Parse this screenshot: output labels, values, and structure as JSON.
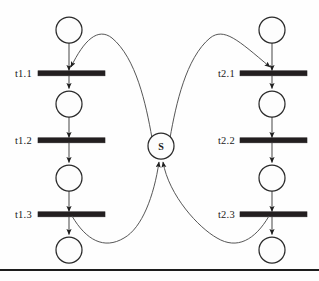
{
  "diagram": {
    "type": "petri-net",
    "geometry": {
      "width": 319,
      "height": 281
    },
    "colors": {
      "background": "#fefefe",
      "place_stroke": "#2b2b2b",
      "place_fill": "#fdfdfd",
      "transition_fill": "#231f20",
      "arc_stroke": "#5d5d5d",
      "curve_stroke": "#4d4d4d",
      "rule_stroke": "#1d1d1d",
      "text": "#1a1a1a"
    },
    "shared_place": {
      "id": "S",
      "label": "S",
      "cx": 161,
      "cy": 146,
      "r": 13
    },
    "columns": [
      {
        "id": "chain-1",
        "cx": 69,
        "label_x": 33,
        "bar_x1": 38,
        "bar_x2": 105,
        "places": [
          {
            "id": "p1.0",
            "cy": 30,
            "r": 13
          },
          {
            "id": "p1.1",
            "cy": 104,
            "r": 13
          },
          {
            "id": "p1.2",
            "cy": 178,
            "r": 13
          },
          {
            "id": "p1.3",
            "cy": 250,
            "r": 13
          }
        ],
        "transitions": [
          {
            "id": "t1.1",
            "label": "t1.1",
            "cy": 73
          },
          {
            "id": "t1.2",
            "label": "t1.2",
            "cy": 140
          },
          {
            "id": "t1.3",
            "label": "t1.3",
            "cy": 214
          }
        ]
      },
      {
        "id": "chain-2",
        "cx": 272,
        "label_x": 236,
        "bar_x1": 240,
        "bar_x2": 307,
        "places": [
          {
            "id": "p2.0",
            "cy": 30,
            "r": 13
          },
          {
            "id": "p2.1",
            "cy": 104,
            "r": 13
          },
          {
            "id": "p2.2",
            "cy": 178,
            "r": 13
          },
          {
            "id": "p2.3",
            "cy": 250,
            "r": 13
          }
        ],
        "transitions": [
          {
            "id": "t2.1",
            "label": "t2.1",
            "cy": 73
          },
          {
            "id": "t2.2",
            "label": "t2.2",
            "cy": 140
          },
          {
            "id": "t2.3",
            "label": "t2.3",
            "cy": 214
          }
        ]
      }
    ],
    "labels": {
      "t1_1": "t1.1",
      "t1_2": "t1.2",
      "t1_3": "t1.3",
      "t2_1": "t2.1",
      "t2_2": "t2.2",
      "t2_3": "t2.3",
      "shared": "S"
    },
    "arcs": {
      "shared_to_t1_1": "S → t1.1",
      "shared_to_t2_1": "S → t2.1",
      "t1_3_to_shared": "t1.3 → S",
      "t2_3_to_shared": "t2.3 → S"
    },
    "bottom_rule": {
      "y": 270,
      "x1": 0,
      "x2": 319
    }
  }
}
